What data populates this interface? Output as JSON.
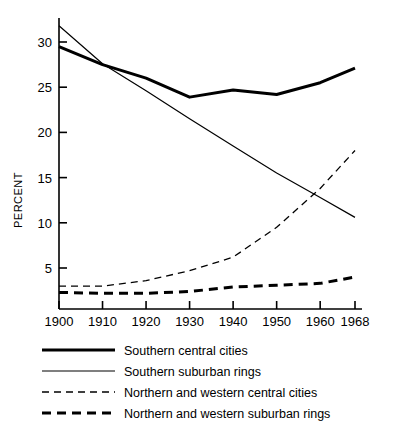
{
  "chart_data": {
    "type": "line",
    "title": "",
    "xlabel": "",
    "ylabel": "PERCENT",
    "x": [
      1900,
      1910,
      1920,
      1930,
      1940,
      1950,
      1960,
      1968
    ],
    "xtick_labels": [
      "1900",
      "1910",
      "1920",
      "1930",
      "1940",
      "1950",
      "1960",
      "1968"
    ],
    "ytick_labels": [
      "5",
      "10",
      "15",
      "20",
      "25",
      "30"
    ],
    "yticks": [
      5,
      10,
      15,
      20,
      25,
      30
    ],
    "ylim": [
      1.6,
      32.5
    ],
    "xlim": [
      1900,
      1968
    ],
    "grid": false,
    "legend_position": "below",
    "series": [
      {
        "name": "Southern central cities",
        "style": "thick-solid",
        "values": [
          29.5,
          27.5,
          26.0,
          23.9,
          24.7,
          24.2,
          25.5,
          27.1
        ]
      },
      {
        "name": "Southern suburban rings",
        "style": "thin-solid",
        "values": [
          31.8,
          27.6,
          24.6,
          21.5,
          18.5,
          15.5,
          12.8,
          10.6
        ]
      },
      {
        "name": "Northern and western central cities",
        "style": "thin-dashed",
        "values": [
          3.0,
          3.0,
          3.6,
          4.7,
          6.2,
          9.5,
          13.8,
          18.0
        ]
      },
      {
        "name": "Northern and western suburban rings",
        "style": "thick-dashed",
        "values": [
          2.3,
          2.2,
          2.2,
          2.4,
          2.9,
          3.1,
          3.3,
          4.0
        ]
      }
    ]
  },
  "axis": {
    "y_title": "PERCENT"
  },
  "ticks": {
    "y": [
      "30",
      "25",
      "20",
      "15",
      "10",
      "5"
    ],
    "x": [
      "1900",
      "1910",
      "1920",
      "1930",
      "1940",
      "1950",
      "1960",
      "1968"
    ]
  },
  "legend": {
    "items": [
      {
        "label": "Southern central cities",
        "style": "thick-solid"
      },
      {
        "label": "Southern suburban rings",
        "style": "thin-solid"
      },
      {
        "label": "Northern and western central cities",
        "style": "thin-dashed"
      },
      {
        "label": "Northern and western suburban rings",
        "style": "thick-dashed"
      }
    ]
  },
  "colors": {
    "ink": "#000000",
    "background": "#ffffff"
  }
}
